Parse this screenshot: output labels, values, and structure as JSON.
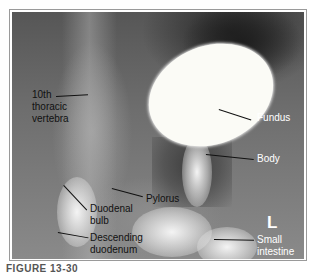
{
  "figure": {
    "caption": "FIGURE 13-30",
    "orientation_marker": "L",
    "labels": [
      {
        "id": "vertebra",
        "text": "10th\nthoracic\nvertebra",
        "lines": [
          "10th",
          "thoracic",
          "vertebra"
        ]
      },
      {
        "id": "fundus",
        "text": "Fundus"
      },
      {
        "id": "body",
        "text": "Body"
      },
      {
        "id": "pylorus",
        "text": "Pylorus"
      },
      {
        "id": "duodenal_bulb",
        "text": "Duodenal\nbulb",
        "lines": [
          "Duodenal",
          "bulb"
        ]
      },
      {
        "id": "descending_duodenum",
        "text": "Descending\nduodenum",
        "lines": [
          "Descending",
          "duodenum"
        ]
      },
      {
        "id": "small_intestine",
        "text": "Small\nintestine",
        "lines": [
          "Small",
          "intestine"
        ]
      }
    ]
  }
}
